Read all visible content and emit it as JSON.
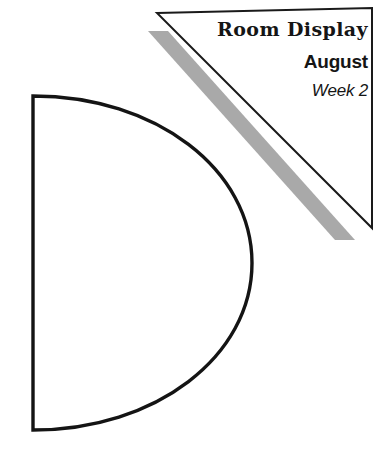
{
  "page": {
    "width": 387,
    "height": 458,
    "background_color": "#ffffff"
  },
  "header": {
    "title": "Room Display",
    "month": "August",
    "week": "Week 2"
  },
  "graphics": {
    "banner_triangle": {
      "name": "banner-triangle",
      "fill_color": "#ffffff",
      "stroke_color": "#1a1a1a",
      "stroke_width": 2,
      "points": "157,13 372,8 372,228"
    },
    "diagonal_band": {
      "name": "diagonal-accent-band",
      "fill_color": "#a9a9a9",
      "points": "148,31 168,31 355,240 335,240"
    },
    "d_shape": {
      "name": "half-disc-outline",
      "stroke_color": "#141414",
      "stroke_width": 3.4,
      "fill_color": "none",
      "spine_x": 33,
      "top_y": 96,
      "bottom_y": 430,
      "bulge_x": 252
    }
  }
}
